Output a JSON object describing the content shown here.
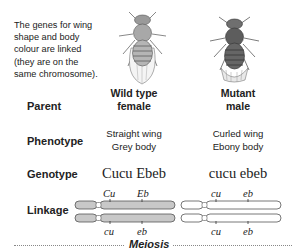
{
  "intro_text": [
    "The genes for wing",
    "shape and body",
    "colour are linked",
    "(they are on the",
    "same chromosome)."
  ],
  "rows": {
    "parent": "Parent",
    "phenotype": "Phenotype",
    "genotype": "Genotype",
    "linkage": "Linkage"
  },
  "parents": [
    {
      "title_line1": "Wild type",
      "title_line2": "female",
      "phenotype_line1": "Straight wing",
      "phenotype_line2": "Grey body",
      "genotype": "Cucu Ebeb",
      "fly_image": "wild-type-fruit-fly",
      "chromosome_color": "#c8c8c8",
      "chromosome_top": {
        "allele1": "Cu",
        "allele2": "Eb"
      },
      "chromosome_bottom": {
        "allele1": "cu",
        "allele2": "eb"
      }
    },
    {
      "title_line1": "Mutant",
      "title_line2": "male",
      "phenotype_line1": "Curled wing",
      "phenotype_line2": "Ebony body",
      "genotype": "cucu ebeb",
      "fly_image": "mutant-fruit-fly",
      "chromosome_color": "#ffffff",
      "chromosome_top": {
        "allele1": "cu",
        "allele2": "eb"
      },
      "chromosome_bottom": {
        "allele1": "cu",
        "allele2": "eb"
      }
    }
  ],
  "footer_label": "Meiosis"
}
